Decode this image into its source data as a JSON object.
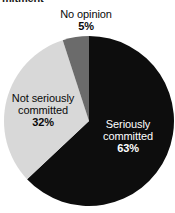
{
  "title_fragment": "mitment",
  "colors": {
    "background": "#ffffff",
    "seriously_committed": "#0d0d0d",
    "not_seriously_committed": "#d8d8d8",
    "no_opinion": "#6b6b6b",
    "label_dark": "#0a0a0a",
    "label_light": "#ffffff"
  },
  "labels": {
    "no_opinion": {
      "name": "No opinion",
      "pct": "5%"
    },
    "not_seriously_committed": {
      "name_line1": "Not seriously",
      "name_line2": "committed",
      "pct": "32%"
    },
    "seriously_committed": {
      "name_line1": "Seriously",
      "name_line2": "committed",
      "pct": "63%"
    }
  },
  "chart_data": {
    "type": "pie",
    "title": "mitment",
    "xlabel": "",
    "ylabel": "",
    "legend_position": "none",
    "grid": false,
    "start_angle_deg": 0,
    "direction": "clockwise",
    "center": {
      "x": 89,
      "y": 121
    },
    "radius": 85,
    "categories": [
      "Seriously committed",
      "Not seriously committed",
      "No opinion"
    ],
    "values": [
      63,
      32,
      5
    ],
    "unit": "%",
    "slices": [
      {
        "label": "Seriously committed",
        "value": 63,
        "display": "63%",
        "color": "#0d0d0d",
        "start_angle_deg": 0.0,
        "end_angle_deg": 226.8,
        "label_color": "#ffffff",
        "label_inside": true
      },
      {
        "label": "Not seriously committed",
        "value": 32,
        "display": "32%",
        "color": "#d8d8d8",
        "start_angle_deg": 226.8,
        "end_angle_deg": 342.0,
        "label_color": "#0a0a0a",
        "label_inside": true
      },
      {
        "label": "No opinion",
        "value": 5,
        "display": "5%",
        "color": "#6b6b6b",
        "start_angle_deg": 342.0,
        "end_angle_deg": 360.0,
        "label_color": "#0a0a0a",
        "label_inside": false
      }
    ]
  }
}
